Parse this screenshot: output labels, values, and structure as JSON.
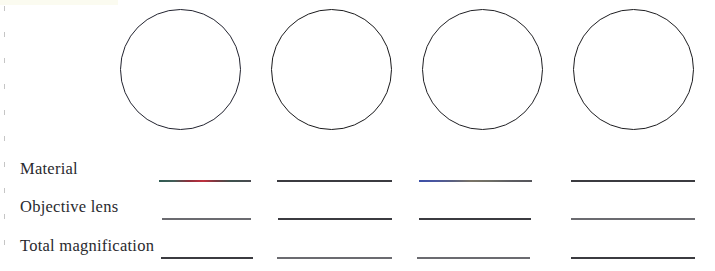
{
  "page": {
    "background_color": "#ffffff"
  },
  "diagram": {
    "name": "microscope-field-of-view-circles",
    "count": 4,
    "circles": [
      {
        "label": "",
        "outline_color": "#22232f"
      },
      {
        "label": "",
        "outline_color": "#1a1a1c"
      },
      {
        "label": "",
        "outline_color": "#202024"
      },
      {
        "label": "",
        "outline_color": "#1d1d20"
      }
    ]
  },
  "answer_table": {
    "columns": 4,
    "rows": [
      {
        "label": "Material",
        "answers": [
          "",
          "",
          "",
          ""
        ]
      },
      {
        "label": "Objective lens",
        "answers": [
          "",
          "",
          "",
          ""
        ]
      },
      {
        "label": "Total magnification",
        "answers": [
          "",
          "",
          "",
          ""
        ]
      }
    ]
  },
  "colors": {
    "ink": "#2a2a2e",
    "rule": "#5d5d62",
    "circle_outline": "#1b1b22",
    "scan_tint": "#fbfbf0"
  }
}
